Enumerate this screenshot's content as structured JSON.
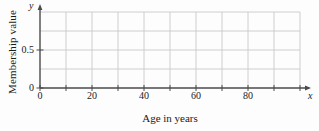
{
  "chart_data": {
    "type": "line",
    "title": "",
    "xlabel": "Age in years",
    "ylabel": "Membership value",
    "x_axis_symbol": "x",
    "y_axis_symbol": "y",
    "xlim": [
      0,
      100
    ],
    "ylim": [
      0,
      1
    ],
    "x_major_ticks": [
      0,
      20,
      40,
      60,
      80
    ],
    "x_major_tick_labels": [
      "0",
      "20",
      "40",
      "60",
      "80"
    ],
    "x_minor_ticks": [
      10,
      30,
      50,
      70,
      90,
      100
    ],
    "y_ticks": [
      0,
      0.5
    ],
    "y_tick_labels": [
      "0",
      "0.5"
    ],
    "y_gridlines": [
      0.25,
      0.5,
      0.75,
      1.0
    ],
    "x_gridlines": [
      10,
      20,
      30,
      40,
      50,
      60,
      70,
      80,
      90,
      100
    ],
    "grid": true,
    "legend": null,
    "series": [],
    "annotations": [],
    "note": "Empty membership-function grid; no data plotted"
  },
  "style": {
    "grid_color": "#c8c8c8",
    "axis_color": "#4a4a4a",
    "text_color": "#1a1a1a",
    "background": "#fdfdfd"
  }
}
